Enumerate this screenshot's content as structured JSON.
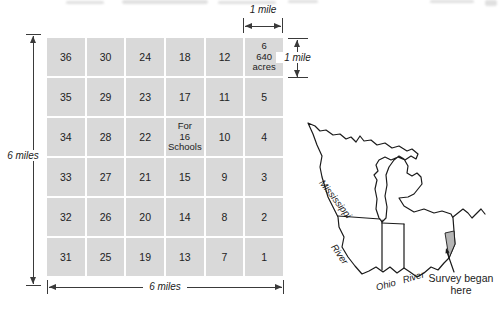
{
  "grid": {
    "cell_color": "#d9d9d9",
    "sections": [
      [
        "36"
      ],
      [
        "30"
      ],
      [
        "24"
      ],
      [
        "18"
      ],
      [
        "12"
      ],
      [
        "6",
        "640",
        "acres"
      ],
      [
        "35"
      ],
      [
        "29"
      ],
      [
        "23"
      ],
      [
        "17"
      ],
      [
        "11"
      ],
      [
        "5"
      ],
      [
        "34"
      ],
      [
        "28"
      ],
      [
        "22"
      ],
      [
        "For",
        "16",
        "Schools"
      ],
      [
        "10"
      ],
      [
        "4"
      ],
      [
        "33"
      ],
      [
        "27"
      ],
      [
        "21"
      ],
      [
        "15"
      ],
      [
        "9"
      ],
      [
        "3"
      ],
      [
        "32"
      ],
      [
        "26"
      ],
      [
        "20"
      ],
      [
        "14"
      ],
      [
        "8"
      ],
      [
        "2"
      ],
      [
        "31"
      ],
      [
        "25"
      ],
      [
        "19"
      ],
      [
        "13"
      ],
      [
        "7"
      ],
      [
        "1"
      ]
    ]
  },
  "dimensions": {
    "left_label": "6 miles",
    "bottom_label": "6 miles",
    "top_label": "1 mile",
    "right_label": "1 mile"
  },
  "map": {
    "river_label_line1": "Mississippi",
    "river_label_line2": "River",
    "ohio_river_label": "Ohio River",
    "survey_note_line1": "Survey began",
    "survey_note_line2": "here",
    "survey_area_color": "#b5b5b5",
    "outline_color": "#1a1a1a"
  }
}
